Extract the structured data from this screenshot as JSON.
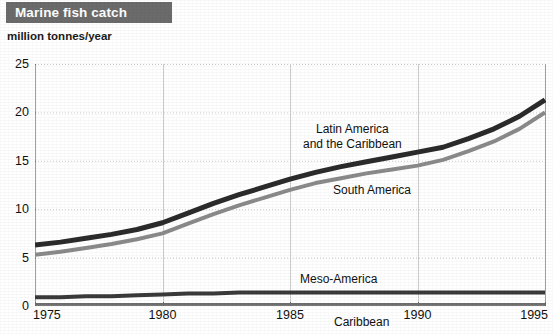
{
  "header": {
    "title": "Marine fish catch",
    "banner_color": "#6b6b6b",
    "banner_text_color": "#ffffff"
  },
  "axis": {
    "unit_label": "million tonnes/year"
  },
  "chart_data": {
    "type": "line",
    "title": "Marine fish catch",
    "subtitle": "",
    "xlabel": "",
    "ylabel": "million tonnes/year",
    "xlim": [
      1975,
      1995
    ],
    "ylim": [
      0,
      25
    ],
    "xticks": [
      1975,
      1980,
      1985,
      1990,
      1995
    ],
    "xtick_labels": [
      "1975",
      "1980",
      "1985",
      "1990",
      "1995"
    ],
    "yticks": [
      0,
      5,
      10,
      15,
      20,
      25
    ],
    "ytick_labels": [
      "0",
      "5",
      "10",
      "15",
      "20",
      "25"
    ],
    "grid": true,
    "grid_color": "#c9c9c9",
    "legend_position": "inline-annotations",
    "x": [
      1975,
      1976,
      1977,
      1978,
      1979,
      1980,
      1981,
      1982,
      1983,
      1984,
      1985,
      1986,
      1987,
      1988,
      1989,
      1990,
      1991,
      1992,
      1993,
      1994,
      1995
    ],
    "series": [
      {
        "name": "Latin America and the Caribbean",
        "color": "#2b2b2b",
        "line_width": 5,
        "label_x": 1987,
        "label_y": 18.1,
        "values": [
          6.3,
          6.6,
          7.0,
          7.4,
          7.9,
          8.6,
          9.6,
          10.6,
          11.5,
          12.3,
          13.1,
          13.8,
          14.4,
          14.9,
          15.4,
          15.9,
          16.4,
          17.3,
          18.3,
          19.6,
          21.3
        ]
      },
      {
        "name": "South America",
        "color": "#8a8a8a",
        "line_width": 4,
        "label_x": 1989,
        "label_y": 12.2,
        "values": [
          5.3,
          5.6,
          6.0,
          6.4,
          6.9,
          7.5,
          8.5,
          9.5,
          10.4,
          11.2,
          12.0,
          12.7,
          13.2,
          13.7,
          14.1,
          14.5,
          15.1,
          16.0,
          17.0,
          18.3,
          20.0
        ]
      },
      {
        "name": "Meso-America",
        "color": "#3a3a3a",
        "line_width": 4,
        "label_x": 1987,
        "label_y": 2.6,
        "values": [
          0.9,
          0.9,
          1.0,
          1.0,
          1.1,
          1.2,
          1.3,
          1.3,
          1.4,
          1.4,
          1.4,
          1.4,
          1.4,
          1.4,
          1.4,
          1.4,
          1.4,
          1.4,
          1.4,
          1.4,
          1.4
        ]
      },
      {
        "name": "Caribbean",
        "color": "#6f6f6f",
        "line_width": 2,
        "label_x": 1987,
        "label_y": -1.0,
        "values": [
          0.2,
          0.2,
          0.2,
          0.2,
          0.2,
          0.2,
          0.2,
          0.2,
          0.2,
          0.2,
          0.2,
          0.2,
          0.2,
          0.2,
          0.2,
          0.2,
          0.2,
          0.2,
          0.2,
          0.2,
          0.2
        ]
      }
    ],
    "annotations": [
      {
        "text": "Latin America\nand the Caribbean",
        "line1": "Latin America",
        "line2": "and the Caribbean"
      },
      {
        "text": "South America",
        "line1": "South America"
      },
      {
        "text": "Meso-America",
        "line1": "Meso-America"
      },
      {
        "text": "Caribbean",
        "line1": "Caribbean"
      }
    ]
  }
}
